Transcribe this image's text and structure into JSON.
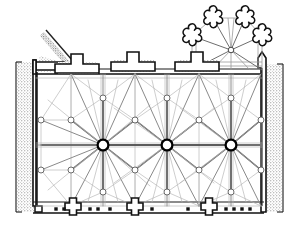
{
  "document": {
    "kind": "architectural-floor-plan",
    "subject": "Gothic hall church star-vault ground plan",
    "title": "",
    "caption": "",
    "background_color": "#ffffff",
    "ink_color": "#111111",
    "rib_colors": {
      "major": "#555555",
      "secondary": "#8a8a8a",
      "fine": "#b4b4b4",
      "hairline": "#cccccc"
    }
  },
  "canvas": {
    "width": 297,
    "height": 234,
    "interior": {
      "x": 36,
      "y": 68,
      "width": 228,
      "height": 136
    }
  },
  "walls": {
    "left": {
      "label": "left-double-wall",
      "outer_x": 15,
      "inner_x": 36,
      "top_y": 60,
      "bottom_y": 212,
      "hatched": true
    },
    "right": {
      "label": "right-double-wall",
      "inner_x": 262,
      "outer_x": 284,
      "top_y": 58,
      "bottom_y": 212,
      "hatched": true
    },
    "top": {
      "label": "north-arcade-wall",
      "y": 74,
      "x_start": 36,
      "x_end": 264
    },
    "bottom": {
      "label": "south-wall",
      "y": 206,
      "x_start": 36,
      "x_end": 264
    }
  },
  "bays": {
    "count": 3,
    "boss_radius": 5.4,
    "centers": [
      {
        "name": "bay-1-boss",
        "x": 103,
        "y": 145
      },
      {
        "name": "bay-2-boss",
        "x": 167,
        "y": 145
      },
      {
        "name": "bay-3-boss",
        "x": 231,
        "y": 145
      }
    ]
  },
  "piers": {
    "top_row": [
      {
        "name": "pier-top-1",
        "x": 77,
        "y": 64,
        "shape": "tau-cross"
      },
      {
        "name": "pier-top-2",
        "x": 133,
        "y": 62,
        "shape": "tau-cross"
      },
      {
        "name": "pier-top-3",
        "x": 197,
        "y": 62,
        "shape": "tau-cross"
      }
    ],
    "bottom_row": [
      {
        "name": "pier-bottom-1",
        "x": 73,
        "y": 209,
        "shape": "greek-cross"
      },
      {
        "name": "pier-bottom-2",
        "x": 135,
        "y": 209,
        "shape": "greek-cross"
      },
      {
        "name": "pier-bottom-3",
        "x": 209,
        "y": 209,
        "shape": "greek-cross"
      }
    ],
    "wall_capitals": [
      {
        "name": "capital-left-top",
        "x": 36,
        "y": 68
      },
      {
        "name": "capital-right-top",
        "x": 262,
        "y": 60
      }
    ]
  },
  "buttress_marks": {
    "name": "south-wall-buttress-squares",
    "size": 3.4,
    "y": 210,
    "x_positions": [
      56,
      64,
      90,
      98,
      110,
      152,
      188,
      226,
      234,
      242,
      250
    ]
  },
  "chapel": {
    "name": "north-east-chapel",
    "boss": {
      "x": 231,
      "y": 50,
      "r": 2.6
    },
    "quatrefoil_piers": [
      {
        "name": "quatrefoil-pier-nw",
        "x": 213,
        "y": 18
      },
      {
        "name": "quatrefoil-pier-ne",
        "x": 245,
        "y": 18
      },
      {
        "name": "quatrefoil-pier-w",
        "x": 192,
        "y": 36
      },
      {
        "name": "quatrefoil-pier-e",
        "x": 262,
        "y": 36
      }
    ]
  },
  "stair": {
    "name": "north-west-stair-turret",
    "points": "48,32 72,62",
    "note": "diagonal hatched ramp at upper left"
  },
  "vault_nodes": {
    "name": "rib-intersection-nodes",
    "radius": 3.0,
    "points": [
      {
        "x": 103,
        "y": 98
      },
      {
        "x": 167,
        "y": 98
      },
      {
        "x": 231,
        "y": 98
      },
      {
        "x": 103,
        "y": 192
      },
      {
        "x": 167,
        "y": 192
      },
      {
        "x": 231,
        "y": 192
      },
      {
        "x": 71,
        "y": 120
      },
      {
        "x": 135,
        "y": 120
      },
      {
        "x": 199,
        "y": 120
      },
      {
        "x": 71,
        "y": 170
      },
      {
        "x": 135,
        "y": 170
      },
      {
        "x": 199,
        "y": 170
      },
      {
        "x": 41,
        "y": 120
      },
      {
        "x": 41,
        "y": 170
      },
      {
        "x": 261,
        "y": 120
      },
      {
        "x": 261,
        "y": 170
      }
    ]
  }
}
